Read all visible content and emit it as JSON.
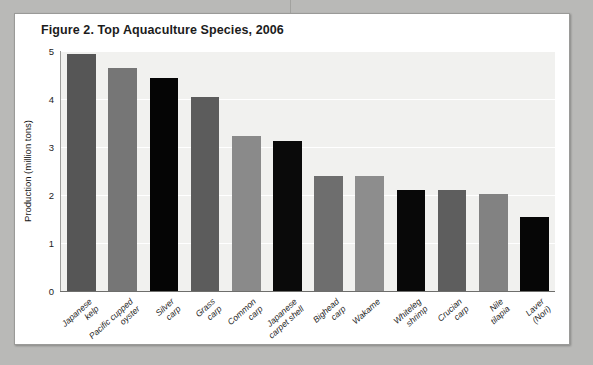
{
  "figure": {
    "title": "Figure 2. Top Aquaculture Species, 2006",
    "source_note": "Source: FAO"
  },
  "chart_data": {
    "type": "bar",
    "title": "Figure 2. Top Aquaculture Species, 2006",
    "xlabel": "",
    "ylabel": "Production (million tons)",
    "ylim": [
      0,
      5
    ],
    "yticks": [
      "0",
      "1",
      "2",
      "3",
      "4",
      "5"
    ],
    "grid": true,
    "legend": null,
    "annotations": [
      "Source: FAO"
    ],
    "categories": [
      "Japanese kelp",
      "Pacific cupped oyster",
      "Silver carp",
      "Grass carp",
      "Common carp",
      "Japanese carpet shell",
      "Bighead carp",
      "Wakame",
      "Whiteleg shrimp",
      "Crucian carp",
      "Nile tilapia",
      "Laver (Nori)"
    ],
    "category_lines": [
      [
        "Japanese",
        "kelp"
      ],
      [
        "Pacific cupped",
        "oyster"
      ],
      [
        "Silver",
        "carp"
      ],
      [
        "Grass",
        "carp"
      ],
      [
        "Common",
        "carp"
      ],
      [
        "Japanese",
        "carpet shell"
      ],
      [
        "Bighead",
        "carp"
      ],
      [
        "Wakame"
      ],
      [
        "Whiteleg",
        "shrimp"
      ],
      [
        "Crucian",
        "carp"
      ],
      [
        "Nile",
        "tilapia"
      ],
      [
        "Laver",
        "(Nori)"
      ]
    ],
    "values": [
      4.93,
      4.65,
      4.43,
      4.05,
      3.22,
      3.12,
      2.4,
      2.4,
      2.1,
      2.1,
      2.02,
      1.55
    ],
    "bar_colors": [
      "#565656",
      "#767676",
      "#050505",
      "#5c5c5c",
      "#8a8a8a",
      "#0a0a0a",
      "#6e6e6e",
      "#8d8d8d",
      "#080808",
      "#5e5e5e",
      "#828282",
      "#060606"
    ],
    "plot_background": "#f1f1ef",
    "gridline_color": "#ffffff"
  }
}
